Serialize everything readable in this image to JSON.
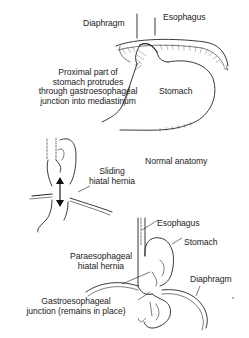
{
  "figure": {
    "panels": [
      {
        "id": "normal",
        "caption": "Normal anatomy",
        "labels": {
          "diaphragm": "Diaphragm",
          "esophagus": "Esophagus",
          "stomach": "Stomach",
          "proximal_line1": "Proximal part of",
          "proximal_line2": "stomach protrudes",
          "proximal_line3": "through gastroesophageal",
          "proximal_line4": "junction into mediastinum"
        }
      },
      {
        "id": "sliding",
        "labels": {
          "line1": "Sliding",
          "line2": "hiatal hernia"
        }
      },
      {
        "id": "paraesophageal",
        "labels": {
          "esophagus": "Esophagus",
          "stomach": "Stomach",
          "diaphragm": "Diaphragm",
          "hernia_line1": "Paraesophageal",
          "hernia_line2": "hiatal hernia",
          "gej_line1": "Gastroesophageal",
          "gej_line2": "junction (remains in place)"
        }
      }
    ]
  }
}
